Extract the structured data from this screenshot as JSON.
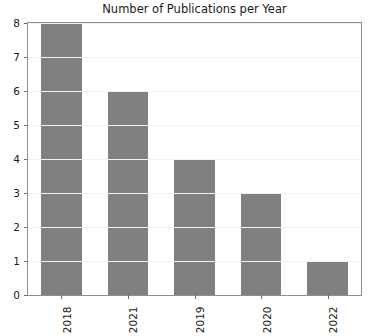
{
  "chart_data": {
    "type": "bar",
    "title": "Number of Publications per Year",
    "xlabel": "",
    "ylabel": "",
    "categories": [
      "2018",
      "2021",
      "2019",
      "2020",
      "2022"
    ],
    "values": [
      8,
      6,
      4,
      3,
      1
    ],
    "ylim": [
      0,
      8
    ],
    "yticks": [
      0,
      1,
      2,
      3,
      4,
      5,
      6,
      7,
      8
    ],
    "ytick_labels": [
      "0",
      "1",
      "2",
      "3",
      "4",
      "5",
      "6",
      "7",
      "8"
    ],
    "grid": true,
    "grid_axis": "y",
    "legend": false,
    "bar_color": "#808080",
    "grid_color": "#f2f2f2",
    "axes_color": "#8f8f8f",
    "text_color": "#1a1a1a",
    "xtick_rotation": 90
  }
}
